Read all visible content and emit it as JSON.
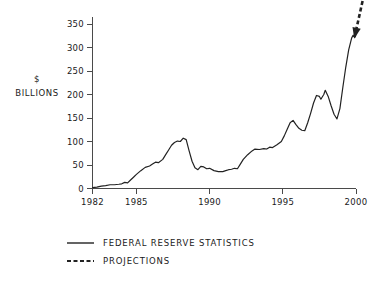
{
  "chart_data": {
    "type": "line",
    "title": "",
    "xlabel": "",
    "ylabel": "$ BILLIONS",
    "ylabel_lines": [
      "$",
      "BILLIONS"
    ],
    "xlim": [
      1982,
      2000
    ],
    "ylim": [
      0,
      365
    ],
    "grid": false,
    "legend_position": "below-left",
    "xticks": [
      1982,
      1985,
      1990,
      1995,
      2000
    ],
    "xtick_labels": [
      "1982",
      "1985",
      "1990",
      "1995",
      "2000"
    ],
    "yticks": [
      0,
      50,
      100,
      150,
      200,
      250,
      300,
      350
    ],
    "ytick_labels": [
      "0",
      "50",
      "100",
      "150",
      "200",
      "250",
      "300",
      "350"
    ],
    "series": [
      {
        "name": "FEDERAL RESERVE STATISTICS",
        "style": "solid",
        "color": "#222222",
        "points": [
          [
            1982.0,
            2
          ],
          [
            1982.3,
            3
          ],
          [
            1982.6,
            5
          ],
          [
            1982.9,
            6
          ],
          [
            1983.2,
            8
          ],
          [
            1983.5,
            8
          ],
          [
            1983.8,
            9
          ],
          [
            1984.0,
            10
          ],
          [
            1984.2,
            13
          ],
          [
            1984.4,
            12
          ],
          [
            1984.6,
            18
          ],
          [
            1984.8,
            24
          ],
          [
            1985.0,
            30
          ],
          [
            1985.3,
            38
          ],
          [
            1985.6,
            45
          ],
          [
            1985.9,
            48
          ],
          [
            1986.1,
            52
          ],
          [
            1986.3,
            56
          ],
          [
            1986.5,
            55
          ],
          [
            1986.8,
            62
          ],
          [
            1987.0,
            72
          ],
          [
            1987.2,
            82
          ],
          [
            1987.4,
            92
          ],
          [
            1987.6,
            98
          ],
          [
            1987.8,
            101
          ],
          [
            1988.0,
            100
          ],
          [
            1988.2,
            107
          ],
          [
            1988.4,
            104
          ],
          [
            1988.6,
            80
          ],
          [
            1988.8,
            58
          ],
          [
            1989.0,
            44
          ],
          [
            1989.2,
            40
          ],
          [
            1989.4,
            47
          ],
          [
            1989.6,
            46
          ],
          [
            1989.8,
            42
          ],
          [
            1990.0,
            43
          ],
          [
            1990.3,
            38
          ],
          [
            1990.6,
            36
          ],
          [
            1990.9,
            36
          ],
          [
            1991.1,
            38
          ],
          [
            1991.3,
            40
          ],
          [
            1991.5,
            41
          ],
          [
            1991.7,
            43
          ],
          [
            1991.9,
            42
          ],
          [
            1992.1,
            52
          ],
          [
            1992.3,
            62
          ],
          [
            1992.6,
            72
          ],
          [
            1992.9,
            80
          ],
          [
            1993.1,
            84
          ],
          [
            1993.4,
            83
          ],
          [
            1993.7,
            85
          ],
          [
            1993.9,
            84
          ],
          [
            1994.1,
            88
          ],
          [
            1994.3,
            87
          ],
          [
            1994.6,
            93
          ],
          [
            1994.9,
            100
          ],
          [
            1995.1,
            112
          ],
          [
            1995.3,
            126
          ],
          [
            1995.5,
            140
          ],
          [
            1995.7,
            145
          ],
          [
            1995.9,
            136
          ],
          [
            1996.1,
            128
          ],
          [
            1996.3,
            124
          ],
          [
            1996.5,
            123
          ],
          [
            1996.7,
            140
          ],
          [
            1996.9,
            160
          ],
          [
            1997.1,
            182
          ],
          [
            1997.3,
            198
          ],
          [
            1997.5,
            196
          ],
          [
            1997.6,
            190
          ],
          [
            1997.8,
            200
          ],
          [
            1997.9,
            209
          ],
          [
            1998.1,
            196
          ],
          [
            1998.3,
            176
          ],
          [
            1998.5,
            158
          ],
          [
            1998.7,
            148
          ],
          [
            1998.9,
            170
          ],
          [
            1999.1,
            215
          ],
          [
            1999.3,
            258
          ],
          [
            1999.5,
            295
          ],
          [
            1999.7,
            320
          ],
          [
            1999.8,
            326
          ],
          [
            1999.9,
            322
          ]
        ]
      },
      {
        "name": "PROJECTIONS",
        "style": "dashed",
        "color": "#222222",
        "points": [
          [
            1999.9,
            322
          ],
          [
            2000.6,
            420
          ]
        ],
        "arrow_at": "start"
      }
    ],
    "legend": [
      {
        "label": "FEDERAL RESERVE STATISTICS",
        "style": "solid"
      },
      {
        "label": "PROJECTIONS",
        "style": "dashed"
      }
    ]
  }
}
